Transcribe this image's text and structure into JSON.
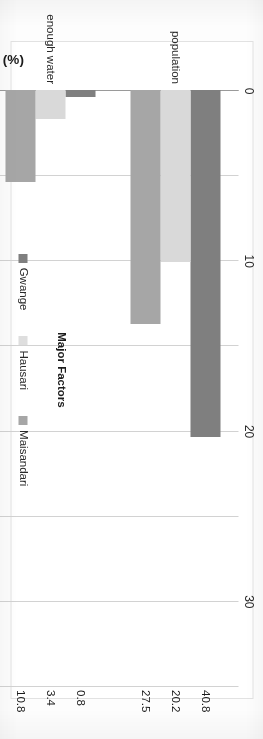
{
  "chart_data": {
    "type": "bar",
    "orientation": "horizontal",
    "title": "",
    "xlabel": "Respondent (%)",
    "ylabel": "Major Factors",
    "categories": [
      "population",
      "enough water",
      "lack of drainage",
      "lack of awareness"
    ],
    "series": [
      {
        "name": "Gwange",
        "color": "#7f7f7f",
        "values": [
          40.8,
          0.8,
          55,
          3.3
        ]
      },
      {
        "name": "Hausari",
        "color": "#d9d9d9",
        "values": [
          20.2,
          3.4,
          63.9,
          11.8
        ]
      },
      {
        "name": "Maisandari",
        "color": "#a6a6a6",
        "values": [
          27.5,
          10.8,
          53.3,
          8.3
        ]
      }
    ],
    "value_labels": [
      [
        "40.8",
        "20.2",
        "27.5"
      ],
      [
        "0.8",
        "3.4",
        "10.8"
      ],
      [
        "55",
        "63.9",
        "53.3"
      ],
      [
        "3.3",
        "11.8",
        "8.3"
      ]
    ],
    "axis_ticks": [
      "0",
      "10",
      "20",
      "30",
      "40",
      "50",
      "60",
      "70"
    ],
    "xlim": [
      0,
      70
    ],
    "grid": true,
    "legend_position": "bottom"
  },
  "axes": {
    "value_axis_title": "Respondent (%)",
    "category_axis_title": "Major Factors"
  },
  "legend": {
    "items": [
      {
        "label": "Gwange"
      },
      {
        "label": "Hausari"
      },
      {
        "label": "Maisandari"
      }
    ]
  }
}
